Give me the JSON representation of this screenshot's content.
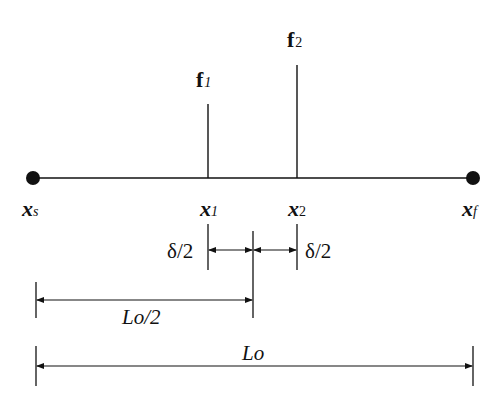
{
  "diagram": {
    "type": "one-dimensional beam with two point forces and dimension lines",
    "colors": {
      "ink": "#111111",
      "background": "#ffffff"
    },
    "main_line": {
      "start_label": "x",
      "start_sub": "s",
      "end_label": "x",
      "end_sub": "f"
    },
    "forces": [
      {
        "label": "f",
        "sub": "1"
      },
      {
        "label": "f",
        "sub": "2"
      }
    ],
    "points": [
      {
        "label": "x",
        "sub": "s"
      },
      {
        "label": "x",
        "sub": "1"
      },
      {
        "label": "x",
        "sub": "2"
      },
      {
        "label": "x",
        "sub": "f"
      }
    ],
    "dimensions": {
      "half_delta_left": "δ/2",
      "half_delta_right": "δ/2",
      "half_length": "Lo/2",
      "full_length": "Lo"
    }
  }
}
